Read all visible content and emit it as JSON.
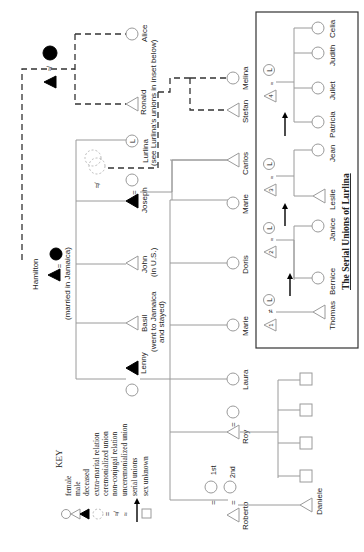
{
  "diagram": {
    "orientation": "rotated 90° counter-clockwise (text reads bottom-to-top)",
    "people": {
      "alice": "Alice",
      "ronald": "Ronald",
      "ronald_note": "(see Lurlina's unions in inset below)",
      "lurlina": "Lurlina",
      "lurlina_initial": "L",
      "hamilton": "Hamilton",
      "hamilton_note": "(married in Jamaica)",
      "joseph": "Joseph",
      "john": "John",
      "john_note": "(in U.S.)",
      "basil": "Basil",
      "basil_note_1": "(went to Jamaica",
      "basil_note_2": "and stayed)",
      "lenny": "Lenny",
      "melina": "Melina",
      "stefan": "Stefan",
      "carlos": "Carlos",
      "marie_1": "Marie",
      "doris": "Doris",
      "marie_2": "Marie",
      "laura": "Laura",
      "roy": "Roy",
      "roberto": "Roberto",
      "daniele": "Daniele",
      "first": "1st",
      "second": "2nd"
    },
    "symbols": {
      "ceremonial": "=",
      "non_conjugal": "≉",
      "extra_marital": "≠"
    }
  },
  "key": {
    "title": "KEY",
    "items": [
      {
        "symbol": "circle",
        "label": "female"
      },
      {
        "symbol": "triangle",
        "label": "male"
      },
      {
        "symbol": "filled-triangle",
        "label": "deceased"
      },
      {
        "symbol": "dotted-circles",
        "label": "extra-marital relation"
      },
      {
        "symbol": "=",
        "label": "ceremonialized union"
      },
      {
        "symbol": "≉",
        "label": "non-conjugal relation"
      },
      {
        "symbol": "≈",
        "label": "unceremonialized union"
      },
      {
        "symbol": "arrow",
        "label": "serial unions"
      },
      {
        "symbol": "square",
        "label": "sex unknown"
      }
    ]
  },
  "inset": {
    "title": "The Serial Unions of Lurlina",
    "unions": [
      {
        "number": "1",
        "symbol": "≠",
        "children": [
          "Thomas"
        ]
      },
      {
        "number": "2",
        "symbol": "≈",
        "children": [
          "Bernice",
          "Janice"
        ]
      },
      {
        "number": "3",
        "symbol": "≈",
        "children": [
          "Leslie",
          "Jean"
        ]
      },
      {
        "number": "4",
        "symbol": "≈",
        "children": [
          "Patricia",
          "Juliet",
          "Judith",
          "Celia"
        ]
      }
    ],
    "partner_initial": "L"
  }
}
